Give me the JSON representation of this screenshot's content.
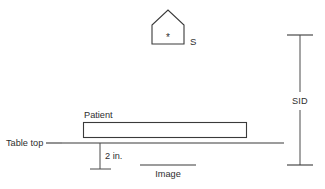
{
  "diagram": {
    "background_color": "#ffffff",
    "stroke_color": "#3a3a3a",
    "text_color": "#2e2e2e",
    "labels": {
      "source": "S",
      "focal_spot_marker": "*",
      "patient": "Patient",
      "table_top": "Table top",
      "gap_dimension": "2 in.",
      "image": "Image",
      "sid": "SID"
    },
    "icons": {
      "source_shape": "x-ray-tube-pentagon-icon",
      "focal_spot": "focal-spot-asterisk-icon",
      "patient_shape": "patient-rectangle-icon",
      "table_line": "table-top-line-icon",
      "image_receptor": "image-receptor-line-icon",
      "sid_dimension": "sid-dimension-line-icon",
      "gap_dimension": "gap-dimension-line-icon"
    },
    "geometry": {
      "source_pentagon_points": "152,44 152,25 168,10 184,25 184,44",
      "focal_spot_x": 168,
      "focal_spot_y": 38,
      "source_label_x": 190,
      "source_label_y": 45,
      "patient_label_x": 84,
      "patient_label_y": 118,
      "patient_rect_x": 83,
      "patient_rect_y": 122,
      "patient_rect_w": 164,
      "patient_rect_h": 16,
      "table_line_x1": 62,
      "table_line_x2": 284,
      "table_line_y": 143,
      "table_label_x": 6,
      "table_label_y": 146,
      "table_leader_x1": 46,
      "table_leader_x2": 62,
      "gap_line_x": 100,
      "gap_line_y1": 143,
      "gap_line_y2": 169,
      "gap_tick_x1": 90,
      "gap_tick_x2": 110,
      "gap_label_x": 105,
      "gap_label_y": 159,
      "image_line_x1": 140,
      "image_line_x2": 196,
      "image_line_y": 165,
      "image_label_x": 153,
      "image_label_y": 177,
      "sid_line_x": 300,
      "sid_line_y1": 35,
      "sid_line_y2": 165,
      "sid_cap_x1": 287,
      "sid_cap_x2": 313,
      "sid_label_x": 300,
      "sid_label_y": 104,
      "sid_gap_top": 92,
      "sid_gap_bottom": 108
    }
  }
}
